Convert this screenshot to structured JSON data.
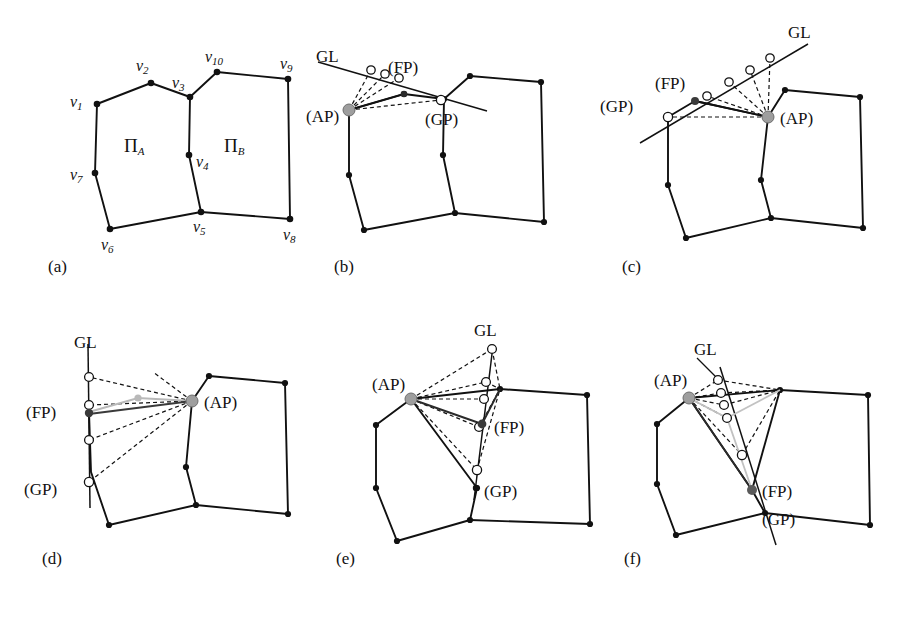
{
  "figure": {
    "background": "#ffffff",
    "stroke_dark": "#111111",
    "stroke_gray": "#b3b3b3",
    "stroke_mid": "#4d4d4d",
    "ap_fill": "#9e9e9e",
    "fp_fill": "#4a4a4a",
    "circle_fill": "#ffffff"
  },
  "panels": [
    {
      "id": "a",
      "caption": "(a)",
      "face_labels": [
        {
          "base": "Π",
          "sub": "A"
        },
        {
          "base": "Π",
          "sub": "B"
        }
      ],
      "vertex_labels": [
        {
          "base": "v",
          "sub": "1"
        },
        {
          "base": "v",
          "sub": "2"
        },
        {
          "base": "v",
          "sub": "3"
        },
        {
          "base": "v",
          "sub": "4"
        },
        {
          "base": "v",
          "sub": "5"
        },
        {
          "base": "v",
          "sub": "6"
        },
        {
          "base": "v",
          "sub": "7"
        },
        {
          "base": "v",
          "sub": "8"
        },
        {
          "base": "v",
          "sub": "9"
        },
        {
          "base": "v",
          "sub": "10"
        }
      ]
    },
    {
      "id": "b",
      "caption": "(b)",
      "markers": [
        "GL",
        "(FP)",
        "(AP)",
        "(GP)"
      ]
    },
    {
      "id": "c",
      "caption": "(c)",
      "markers": [
        "GL",
        "(FP)",
        "(GP)",
        "(AP)"
      ]
    },
    {
      "id": "d",
      "caption": "(d)",
      "markers": [
        "GL",
        "(FP)",
        "(GP)",
        "(AP)"
      ]
    },
    {
      "id": "e",
      "caption": "(e)",
      "markers": [
        "GL",
        "(AP)",
        "(FP)",
        "(GP)"
      ]
    },
    {
      "id": "f",
      "caption": "(f)",
      "markers": [
        "GL",
        "(AP)",
        "(FP)",
        "(GP)"
      ]
    }
  ],
  "chart_data": {
    "type": "diagram",
    "title": "",
    "panel_a": {
      "polygon_A": [
        [
          97,
          104
        ],
        [
          151,
          83
        ],
        [
          190,
          97
        ],
        [
          189,
          155
        ],
        [
          201,
          212
        ],
        [
          110,
          229
        ],
        [
          95,
          173
        ]
      ],
      "polygon_B": [
        [
          189,
          97
        ],
        [
          217,
          72
        ],
        [
          288,
          79
        ],
        [
          290,
          219
        ],
        [
          201,
          212
        ]
      ],
      "vertices": {
        "v1": [
          97,
          104
        ],
        "v2": [
          151,
          83
        ],
        "v3": [
          189,
          97
        ],
        "v4": [
          189,
          155
        ],
        "v5": [
          201,
          212
        ],
        "v6": [
          110,
          229
        ],
        "v7": [
          95,
          173
        ],
        "v8": [
          290,
          219
        ],
        "v9": [
          288,
          79
        ],
        "v10": [
          217,
          72
        ]
      },
      "label_positions": {
        "v1": [
          73,
          100
        ],
        "v2": [
          139,
          66
        ],
        "v3": [
          178,
          83
        ],
        "v4": [
          199,
          163
        ],
        "v5": [
          197,
          226
        ],
        "v6": [
          105,
          245
        ],
        "v7": [
          72,
          174
        ],
        "v8": [
          290,
          235
        ],
        "v9": [
          281,
          65
        ],
        "v10": [
          210,
          59
        ],
        "PiA": [
          133,
          145
        ],
        "PiB": [
          233,
          145
        ]
      }
    },
    "panel_b": {
      "gl_line": [
        [
          318,
          62
        ],
        [
          487,
          111
        ]
      ],
      "gl_label": [
        316,
        60
      ],
      "ap": [
        349,
        110
      ],
      "fp": [
        404,
        94
      ],
      "gp": [
        441,
        100
      ],
      "circles": [
        [
          371,
          70
        ],
        [
          384,
          74
        ],
        [
          398,
          78
        ]
      ],
      "labels": {
        "GL": [
          318,
          58
        ],
        "FP": [
          403,
          74
        ],
        "AP": [
          313,
          117
        ],
        "GP": [
          438,
          120
        ]
      }
    },
    "panel_c": {
      "gl_line": [
        [
          628,
          145
        ],
        [
          806,
          42
        ]
      ],
      "ap": [
        768,
        117
      ],
      "fp": [
        695,
        101
      ],
      "gp": [
        668,
        117
      ],
      "circles": [
        [
          705,
          97
        ],
        [
          730,
          82
        ],
        [
          751,
          70
        ],
        [
          770,
          59
        ]
      ],
      "labels": {
        "GL": [
          781,
          33
        ],
        "FP": [
          664,
          82
        ],
        "GP": [
          612,
          99
        ],
        "AP": [
          780,
          117
        ]
      }
    },
    "panel_d": {
      "gl_line": [
        [
          88,
          344
        ],
        [
          90,
          505
        ]
      ],
      "ap": [
        192,
        401
      ],
      "fp": [
        89,
        412
      ],
      "gp": [
        89,
        482
      ],
      "circles": [
        [
          89,
          377
        ],
        [
          89,
          412
        ],
        [
          89,
          440
        ],
        [
          89,
          482
        ]
      ],
      "gray_pt": [
        138,
        398
      ],
      "labels": {
        "GL": [
          76,
          342
        ],
        "FP": [
          40,
          410
        ],
        "GP": [
          38,
          502
        ],
        "AP": [
          203,
          401
        ]
      }
    },
    "panel_e": {
      "gl_line": [
        [
          493,
          347
        ],
        [
          475,
          498
        ]
      ],
      "ap": [
        411,
        399
      ],
      "fp": [
        482,
        425
      ],
      "gp": [
        477,
        488
      ],
      "circles": [
        [
          492,
          348
        ],
        [
          486,
          382
        ],
        [
          484,
          399
        ],
        [
          478,
          427
        ],
        [
          477,
          470
        ]
      ],
      "labels": {
        "GL": [
          478,
          330
        ],
        "AP": [
          381,
          383
        ],
        "FP": [
          497,
          430
        ],
        "GP": [
          483,
          495
        ]
      }
    },
    "panel_f": {
      "gl_line": [
        [
          723,
          353
        ],
        [
          768,
          535
        ]
      ],
      "ap": [
        689,
        398
      ],
      "fp": [
        752,
        490
      ],
      "gp": [
        765,
        513
      ],
      "circles": [
        [
          718,
          380
        ],
        [
          722,
          394
        ],
        [
          724,
          405
        ],
        [
          727,
          418
        ],
        [
          742,
          455
        ]
      ],
      "labels": {
        "GL": [
          697,
          354
        ],
        "AP": [
          665,
          382
        ],
        "FP": [
          763,
          490
        ],
        "GP": [
          765,
          515
        ]
      }
    }
  }
}
